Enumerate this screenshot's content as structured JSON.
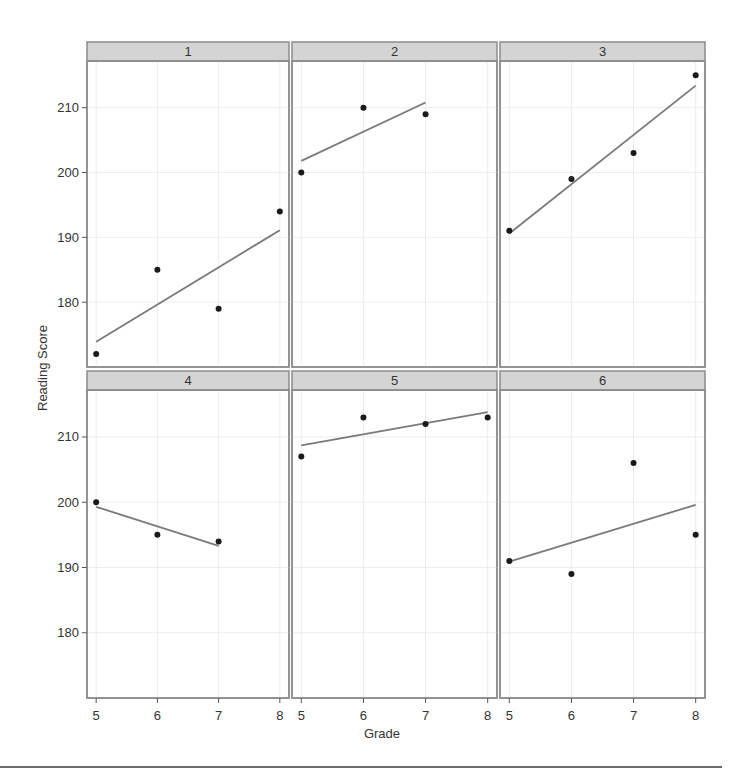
{
  "chart_data": {
    "type": "scatter",
    "layout": "trellis 2x3 panels with per-panel linear fit lines",
    "xlabel": "Grade",
    "ylabel": "Reading Score",
    "xlim": [
      4.85,
      8.15
    ],
    "ylim": [
      170,
      217.2
    ],
    "x_ticks": [
      5,
      6,
      7,
      8
    ],
    "y_ticks": [
      180,
      190,
      200,
      210
    ],
    "grid": true,
    "legend": null,
    "panels": [
      {
        "label": "1",
        "x": [
          5,
          6,
          7,
          8
        ],
        "y": [
          172,
          185,
          179,
          194
        ],
        "fit": {
          "x": [
            5,
            8
          ],
          "y": [
            173.9,
            191.1
          ]
        }
      },
      {
        "label": "2",
        "x": [
          5,
          6,
          7
        ],
        "y": [
          200,
          210,
          209
        ],
        "fit": {
          "x": [
            5,
            7
          ],
          "y": [
            201.8,
            210.8
          ]
        }
      },
      {
        "label": "3",
        "x": [
          5,
          6,
          7,
          8
        ],
        "y": [
          191,
          199,
          203,
          215
        ],
        "fit": {
          "x": [
            5,
            8
          ],
          "y": [
            190.6,
            213.4
          ]
        }
      },
      {
        "label": "4",
        "x": [
          5,
          6,
          7
        ],
        "y": [
          200,
          195,
          194
        ],
        "fit": {
          "x": [
            5,
            7
          ],
          "y": [
            199.3,
            193.3
          ]
        }
      },
      {
        "label": "5",
        "x": [
          5,
          6,
          7,
          8
        ],
        "y": [
          207,
          213,
          212,
          213
        ],
        "fit": {
          "x": [
            5,
            8
          ],
          "y": [
            208.7,
            213.8
          ]
        }
      },
      {
        "label": "6",
        "x": [
          5,
          6,
          7,
          8
        ],
        "y": [
          191,
          189,
          206,
          195
        ],
        "fit": {
          "x": [
            5,
            8
          ],
          "y": [
            190.9,
            199.6
          ]
        }
      }
    ]
  },
  "colors": {
    "strip_fill": "#d4d4d4",
    "frame": "#8c8c8c",
    "fit_line": "#7a7a7a",
    "points": "#1a1a1a",
    "grid": "#ececec"
  }
}
